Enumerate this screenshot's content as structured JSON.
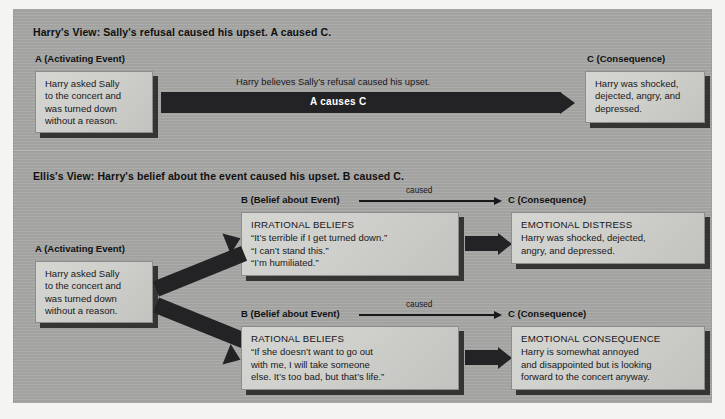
{
  "diagram": {
    "title_harry": "Harry's View: Sally's refusal caused his upset. A caused C.",
    "title_ellis": "Ellis's View: Harry's belief about the event caused his upset. B caused C."
  },
  "headers": {
    "a_top": "A (Activating Event)",
    "a_bottom": "A (Activating Event)",
    "c_top": "C (Consequence)",
    "b_upper": "B (Belief about Event)",
    "c_upper": "C (Consequence)",
    "b_lower": "B (Belief about Event)",
    "c_lower": "C (Consequence)"
  },
  "boxes": {
    "activating_top": {
      "lines": [
        "Harry asked Sally",
        "to the concert and",
        "was turned down",
        "without a reason."
      ]
    },
    "consequence_top": {
      "lines": [
        "Harry was shocked,",
        "dejected, angry, and",
        "depressed."
      ]
    },
    "activating_bottom": {
      "lines": [
        "Harry asked Sally",
        "to the concert and",
        "was turned down",
        "without a reason."
      ]
    },
    "irrational": {
      "heading": "IRRATIONAL BELIEFS",
      "lines": [
        "“It’s terrible if I get turned down.”",
        "“I can’t stand this.”",
        "“I’m humiliated.”"
      ]
    },
    "distress": {
      "heading": "EMOTIONAL DISTRESS",
      "lines": [
        "Harry was shocked, dejected,",
        "angry, and depressed."
      ]
    },
    "rational": {
      "heading": "RATIONAL BELIEFS",
      "lines": [
        "“If she doesn’t want to go out",
        "with me, I will take someone",
        "else. It’s too bad, but that’s life.”"
      ]
    },
    "consequence_rational": {
      "heading": "EMOTIONAL CONSEQUENCE",
      "lines": [
        "Harry is somewhat annoyed",
        "and disappointed but is looking",
        "forward to the concert anyway."
      ]
    }
  },
  "arrows": {
    "top_caption": "Harry believes Sally’s refusal caused his upset.",
    "top_label": "A causes C",
    "caused_upper": "caused",
    "caused_lower": "caused"
  },
  "colors": {
    "panel": "#a8a8a6",
    "box_face": "#cfcfcb",
    "arrow": "#232325",
    "text": "#18181a"
  }
}
